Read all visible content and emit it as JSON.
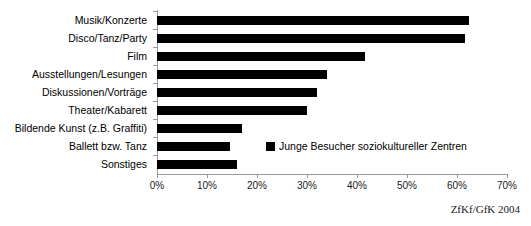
{
  "chart_data": {
    "type": "bar",
    "orientation": "horizontal",
    "title": "Junge Besucher haben",
    "categories": [
      "Musik/Konzerte",
      "Disco/Tanz/Party",
      "Film",
      "Ausstellungen/Lesungen",
      "Diskussionen/Vorträge",
      "Theater/Kabarett",
      "Bildende Kunst (z.B. Graffiti)",
      "Ballett bzw. Tanz",
      "Sonstiges"
    ],
    "values": [
      62.3,
      61.5,
      41.5,
      34.0,
      32.0,
      30.0,
      17.0,
      14.5,
      16.0
    ],
    "series": [
      {
        "name": "Junge Besucher soziokultureller Zentren",
        "values": [
          62.3,
          61.5,
          41.5,
          34.0,
          32.0,
          30.0,
          17.0,
          14.5,
          16.0
        ]
      }
    ],
    "xlabel": "",
    "ylabel": "",
    "xlim": [
      0,
      70
    ],
    "xticks": [
      0,
      10,
      20,
      30,
      40,
      50,
      60,
      70
    ],
    "xtick_labels": [
      "0%",
      "10%",
      "20%",
      "30%",
      "40%",
      "50%",
      "60%",
      "70%"
    ],
    "grid": false,
    "legend_position": "inside-right",
    "bar_color": "#000000",
    "axis_color": "#9a9a9a"
  },
  "legend": {
    "label": "Junge Besucher soziokultureller Zentren",
    "marker": "black-square"
  },
  "footer": {
    "source": "ZfKf/GfK 2004"
  }
}
